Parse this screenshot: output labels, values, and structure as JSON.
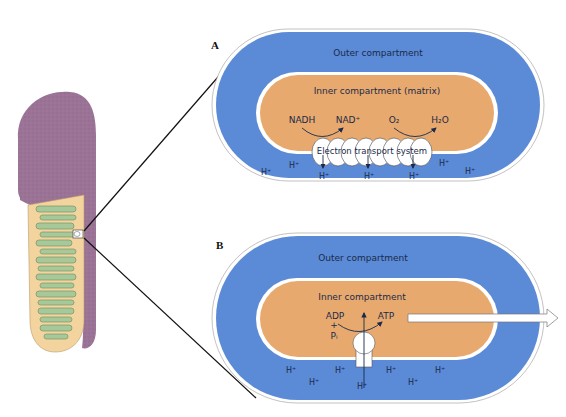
{
  "colors": {
    "outer_compartment": "#5b8ad6",
    "inner_compartment": "#e8a96e",
    "membrane": "#ffffff",
    "mito_outer": "#9a7396",
    "mito_matrix": "#f3d39e",
    "mito_cristae": "#a7c99a",
    "text": "#1a2a4a",
    "line": "#111111"
  },
  "mitochondrion": {
    "label": "mitochondrion-cutaway",
    "zoom_marker": "selected-region"
  },
  "panel_a": {
    "letter": "A",
    "outer_label": "Outer compartment",
    "inner_label": "Inner compartment (matrix)",
    "reaction1_reactant": "NADH",
    "reaction1_product": "NAD⁺",
    "reaction2_reactant": "O₂",
    "reaction2_product": "H₂O",
    "ets_label": "Electron transport system",
    "protons": [
      "H⁺",
      "H⁺",
      "H⁺",
      "H⁺",
      "H⁺",
      "H⁺",
      "H⁺"
    ]
  },
  "panel_b": {
    "letter": "B",
    "outer_label": "Outer compartment",
    "inner_label": "Inner compartment",
    "reactant1": "ADP",
    "plus": "+",
    "reactant2": "Pᵢ",
    "product": "ATP",
    "protons": [
      "H⁺",
      "H⁺",
      "H⁺",
      "H⁺",
      "H⁺",
      "H⁺",
      "H⁺"
    ]
  }
}
